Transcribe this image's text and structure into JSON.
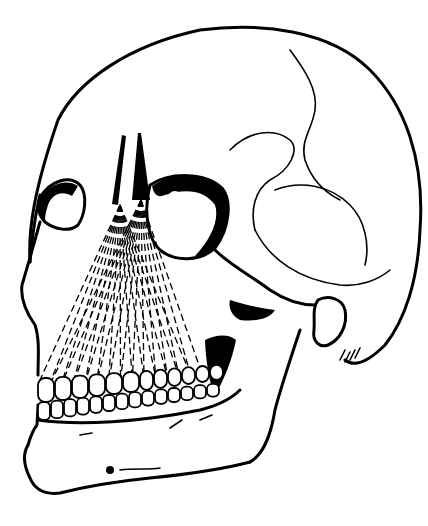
{
  "illustration": {
    "subject": "Human skull, three-quarter view, with dashed projection lines from nasal region to upper dentition",
    "style": "black ink line drawing on white",
    "colors": {
      "ink": "#000000",
      "background": "#ffffff"
    },
    "upper_teeth_count": 12,
    "lower_teeth_count": 14,
    "projection_apexes": 2
  }
}
